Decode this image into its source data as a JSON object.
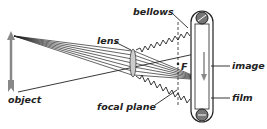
{
  "diagram": {
    "labels": {
      "object": "object",
      "lens": "lens",
      "bellows": "bellows",
      "focal_plane": "focal plane",
      "focal_point": "F",
      "image": "image",
      "film": "film"
    },
    "colors": {
      "line": "#222222",
      "arrow": "#888888",
      "background": "#ffffff"
    }
  }
}
